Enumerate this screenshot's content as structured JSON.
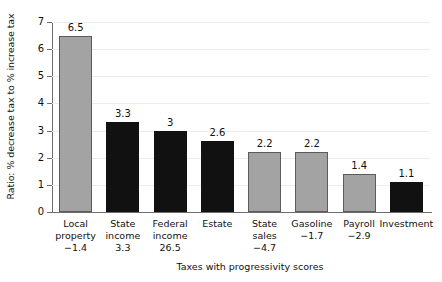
{
  "chart_data": {
    "type": "bar",
    "title": "",
    "xlabel": "Taxes with progressivity scores",
    "ylabel": "Ratio: % decrease tax to % increase tax",
    "ylim": [
      0,
      7
    ],
    "yticks": [
      0,
      1,
      2,
      3,
      4,
      5,
      6,
      7
    ],
    "ytick_labels": [
      "0",
      "1",
      "2",
      "3",
      "4",
      "5",
      "6",
      "7"
    ],
    "grid": true,
    "legend": "none",
    "categories": [
      "Local property",
      "State income",
      "Federal income",
      "Estate",
      "State sales",
      "Gasoline",
      "Payroll",
      "Investment"
    ],
    "category_lines": [
      [
        "Local",
        "property"
      ],
      [
        "State",
        "income"
      ],
      [
        "Federal",
        "income"
      ],
      [
        "Estate"
      ],
      [
        "State",
        "sales"
      ],
      [
        "Gasoline"
      ],
      [
        "Payroll"
      ],
      [
        "Investment"
      ]
    ],
    "progressivity_scores": [
      "−1.4",
      "3.3",
      "26.5",
      "",
      "−4.7",
      "−1.7",
      "−2.9",
      ""
    ],
    "values": [
      6.5,
      3.3,
      3,
      2.6,
      2.2,
      2.2,
      1.4,
      1.1
    ],
    "value_labels": [
      "6.5",
      "3.3",
      "3",
      "2.6",
      "2.2",
      "2.2",
      "1.4",
      "1.1"
    ],
    "bar_colors": [
      "gray",
      "black",
      "black",
      "black",
      "gray",
      "gray",
      "gray",
      "black"
    ],
    "colors": {
      "gray": "#a3a3a3",
      "black": "#111111",
      "bar_outline": "#5c5c5c",
      "axis": "#6d6d6d",
      "grid": "#ececec",
      "background": "#ffffff",
      "text": "#111111"
    }
  }
}
